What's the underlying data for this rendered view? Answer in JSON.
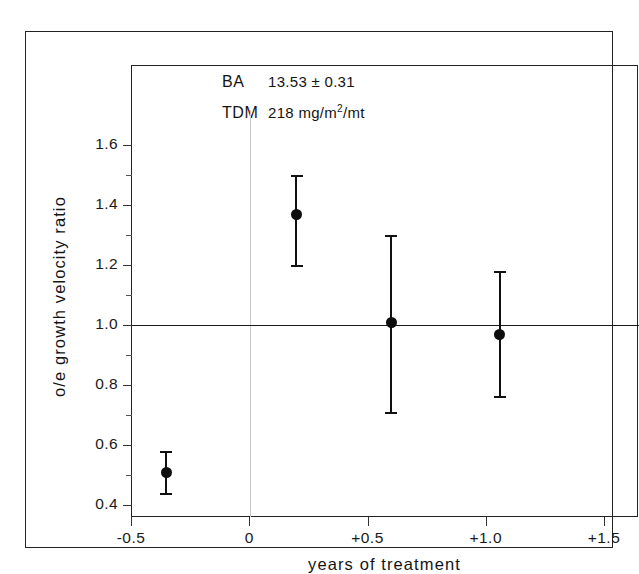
{
  "chart_data": {
    "type": "scatter",
    "title": "",
    "xlabel": "years of treatment",
    "ylabel": "o/e growth velocity ratio",
    "xlim": [
      -0.5,
      1.5
    ],
    "ylim": [
      0.4,
      1.6
    ],
    "grid": false,
    "legend": "none",
    "reference_line": {
      "y": 1.0,
      "label": ""
    },
    "x_ticks": [
      {
        "value": -0.5,
        "label": "-0.5"
      },
      {
        "value": 0,
        "label": "0"
      },
      {
        "value": 0.5,
        "label": "+0.5"
      },
      {
        "value": 1.0,
        "label": "+1.0"
      },
      {
        "value": 1.5,
        "label": "+1.5"
      }
    ],
    "y_ticks": [
      {
        "value": 0.4,
        "label": "0.4"
      },
      {
        "value": 0.6,
        "label": "0.6"
      },
      {
        "value": 0.8,
        "label": "0.8"
      },
      {
        "value": 1.0,
        "label": "1.0"
      },
      {
        "value": 1.2,
        "label": "1.2"
      },
      {
        "value": 1.4,
        "label": "1.4"
      },
      {
        "value": 1.6,
        "label": "1.6"
      }
    ],
    "y_minor_ticks": [
      0.5,
      0.7,
      0.9,
      1.1,
      1.3,
      1.5
    ],
    "points": [
      {
        "x": -0.35,
        "y": 0.51,
        "low": 0.44,
        "high": 0.58
      },
      {
        "x": 0.2,
        "y": 1.37,
        "low": 1.2,
        "high": 1.5
      },
      {
        "x": 0.6,
        "y": 1.01,
        "low": 0.71,
        "high": 1.3
      },
      {
        "x": 1.06,
        "y": 0.97,
        "low": 0.765,
        "high": 1.18
      }
    ]
  },
  "annotation": {
    "ba_key": "BA",
    "ba_value": "13.53 ± 0.31",
    "tdm_key": "TDM",
    "tdm_value_prefix": "218 mg/m",
    "tdm_value_exponent": "2",
    "tdm_value_suffix": "/mt"
  }
}
